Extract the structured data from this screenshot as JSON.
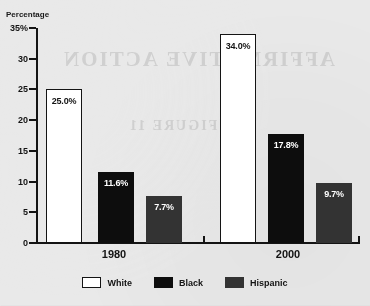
{
  "page": {
    "background_color": "#e9e9e9",
    "clipped_title_fragment": "",
    "bleed_through_text_top": "AFFIRMATIVE ACTION",
    "bleed_through_text_mid": "FIGURE 11"
  },
  "chart_data": {
    "type": "bar",
    "title": "",
    "xlabel": "",
    "ylabel": "Percentage",
    "ylim": [
      0,
      35
    ],
    "ytick_labels": [
      "35%",
      "30",
      "25",
      "20",
      "15",
      "10",
      "5",
      "0"
    ],
    "ytick_values": [
      35,
      30,
      25,
      20,
      15,
      10,
      5,
      0
    ],
    "grid": false,
    "legend_position": "bottom",
    "categories": [
      "1980",
      "2000"
    ],
    "series": [
      {
        "name": "White",
        "color": "#ffffff",
        "values": [
          25.0,
          34.0
        ],
        "labels": [
          "25.0%",
          "34.0%"
        ]
      },
      {
        "name": "Black",
        "color": "#0d0d0d",
        "values": [
          11.6,
          17.8
        ],
        "labels": [
          "11.6%",
          "17.8%"
        ]
      },
      {
        "name": "Hispanic",
        "color": "#333333",
        "values": [
          7.7,
          9.7
        ],
        "labels": [
          "7.7%",
          "9.7%"
        ]
      }
    ]
  },
  "legend": {
    "items": [
      {
        "label": "White",
        "color": "#ffffff"
      },
      {
        "label": "Black",
        "color": "#0d0d0d"
      },
      {
        "label": "Hispanic",
        "color": "#333333"
      }
    ]
  },
  "bars": [
    {
      "key": "1980-white",
      "label": "25.0%",
      "value": 25.0,
      "series": "White",
      "group": "1980",
      "x": 46,
      "w": 36,
      "style": "white"
    },
    {
      "key": "1980-black",
      "label": "11.6%",
      "value": 11.6,
      "series": "Black",
      "group": "1980",
      "x": 98,
      "w": 36,
      "style": "black"
    },
    {
      "key": "1980-hispanic",
      "label": "7.7%",
      "value": 7.7,
      "series": "Hispanic",
      "group": "1980",
      "x": 146,
      "w": 36,
      "style": "hispanic"
    },
    {
      "key": "2000-white",
      "label": "34.0%",
      "value": 34.0,
      "series": "White",
      "group": "2000",
      "x": 220,
      "w": 36,
      "style": "white"
    },
    {
      "key": "2000-black",
      "label": "17.8%",
      "value": 17.8,
      "series": "Black",
      "group": "2000",
      "x": 268,
      "w": 36,
      "style": "black"
    },
    {
      "key": "2000-hispanic",
      "label": "9.7%",
      "value": 9.7,
      "series": "Hispanic",
      "group": "2000",
      "x": 316,
      "w": 36,
      "style": "hispanic"
    }
  ],
  "group_labels": [
    {
      "text": "1980",
      "x": 114
    },
    {
      "text": "2000",
      "x": 288
    }
  ],
  "x_ticks": [
    {
      "x": 203
    },
    {
      "x": 358
    }
  ]
}
